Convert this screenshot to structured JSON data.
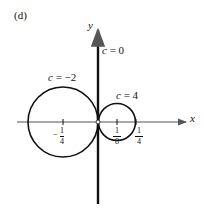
{
  "panel_label": "(d)",
  "axes": {
    "x_label": "x",
    "y_label": "y"
  },
  "curves": [
    {
      "label": "c = 0",
      "c_var": "c",
      "c_eq": "= 0",
      "shape": "line (y-axis)"
    },
    {
      "label": "c = −2",
      "c_var": "c",
      "c_eq": "= −2",
      "shape": "circle",
      "center_x": "-1/8",
      "radius": "1/8"
    },
    {
      "label": "c = 4",
      "c_var": "c",
      "c_eq": "= 4",
      "shape": "circle",
      "center_x": "1/16",
      "radius": "1/16"
    }
  ],
  "ticks": [
    {
      "sign": "−",
      "num": "1",
      "den": "4"
    },
    {
      "sign": "",
      "num": "1",
      "den": "8"
    },
    {
      "sign": "",
      "num": "1",
      "den": "4"
    }
  ],
  "colors": {
    "stroke": "#111111",
    "background": "#ffffff"
  }
}
